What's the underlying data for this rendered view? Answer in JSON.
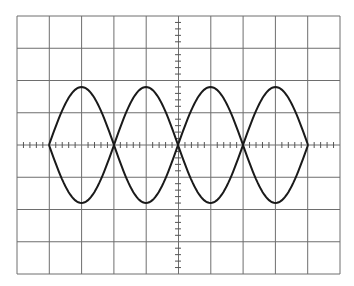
{
  "display": {
    "type": "oscilloscope-graticule",
    "background": "#ffffff",
    "grid_color": "#6e6e6e",
    "trace_color": "#1a1a1a",
    "divisions_x": 10,
    "divisions_y": 8,
    "minor_ticks_per_division": 5
  },
  "graticule": {
    "left": 17,
    "top": 16,
    "right": 340,
    "bottom": 274,
    "center_x": 178,
    "center_y": 145
  },
  "waveform": {
    "description": "Four lobes formed by two mirrored sinusoidal traces (upper and lower), crossing on the horizontal center line",
    "crossings_x": [
      49,
      114,
      178,
      243,
      308
    ],
    "peak_y": 87,
    "trough_y": 203,
    "lobes": 4
  }
}
